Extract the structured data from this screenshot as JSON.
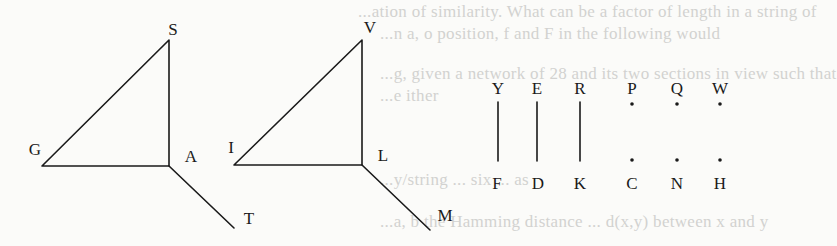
{
  "background_bleedthrough": [
    "...ation of similarity. What can be a factor of length in a string of",
    "...n a, o position, f and F in the following would",
    "...g, given a network of 28 and its two sections in view such that",
    "...e ither",
    "...y/string ... six ... as",
    "...a, b the Hamming distance ... d(x,y) between x and y"
  ],
  "figure": {
    "triangle_1": {
      "vertices": {
        "top": "S",
        "left": "G",
        "right": "A"
      },
      "tail": "T"
    },
    "triangle_2": {
      "vertices": {
        "top": "V",
        "left": "I",
        "right": "L"
      },
      "tail": "M"
    },
    "connected_pairs": [
      {
        "top": "Y",
        "bottom": "F"
      },
      {
        "top": "E",
        "bottom": "D"
      },
      {
        "top": "R",
        "bottom": "K"
      }
    ],
    "unconnected_pairs": [
      {
        "top": "P",
        "bottom": "C"
      },
      {
        "top": "Q",
        "bottom": "N"
      },
      {
        "top": "W",
        "bottom": "H"
      }
    ]
  },
  "colors": {
    "ink": "#1a1a1a",
    "paper": "#fbfbf9",
    "bleed": "#d2d2d0"
  }
}
